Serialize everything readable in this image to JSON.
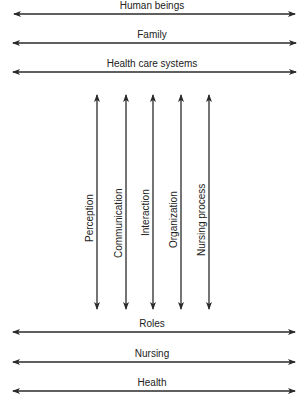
{
  "diagram": {
    "type": "conceptual-framework",
    "top_concepts": [
      {
        "label": "Human beings",
        "y": 14
      },
      {
        "label": "Family",
        "y": 43
      },
      {
        "label": "Health care systems",
        "y": 72
      }
    ],
    "vertical_concepts": [
      {
        "label": "Perception",
        "x": 97
      },
      {
        "label": "Communication",
        "x": 126
      },
      {
        "label": "Interaction",
        "x": 153
      },
      {
        "label": "Organization",
        "x": 181
      },
      {
        "label": "Nursing process",
        "x": 209
      }
    ],
    "bottom_concepts": [
      {
        "label": "Roles",
        "y": 332
      },
      {
        "label": "Nursing",
        "y": 362
      },
      {
        "label": "Health",
        "y": 391
      }
    ],
    "arrow_style": "double-headed",
    "line_color": "#2a2a2a"
  }
}
